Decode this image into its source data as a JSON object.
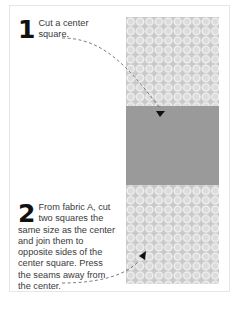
{
  "steps": [
    {
      "number": "1",
      "text": "Cut a center square."
    },
    {
      "number": "2",
      "text": "From fabric A, cut two squares the same size as the center and join them to opposite sides of the center square. Press the seams away from the center."
    }
  ],
  "illustration": {
    "pieces": [
      {
        "name": "fabric-a-top",
        "pattern": "circles"
      },
      {
        "name": "center-square",
        "pattern": "solid"
      },
      {
        "name": "fabric-a-bottom",
        "pattern": "circles"
      }
    ],
    "colors": {
      "center": "#9a9a9a",
      "fabric_bg": "#cfcfcf",
      "circle_stroke": "#f2f2f2",
      "arrow": "#111111",
      "leader_line": "#666666"
    }
  }
}
